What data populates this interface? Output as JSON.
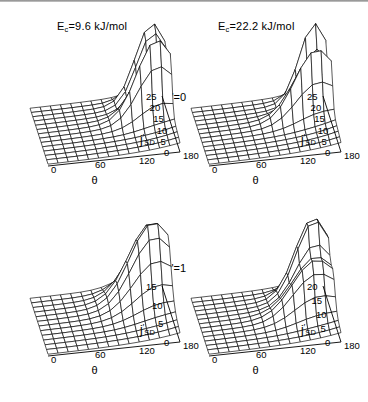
{
  "figure": {
    "background": "#ffffff",
    "line_color": "#000000",
    "top_rule_color": "#8a8a8a"
  },
  "column_titles": [
    {
      "text": "E",
      "sub": "c",
      "rest": "=9.6 kJ/mol",
      "x": 57,
      "y": 20
    },
    {
      "text": "E",
      "sub": "c",
      "rest": "=22.2 kJ/mol",
      "x": 218,
      "y": 20
    }
  ],
  "row_labels": [
    {
      "text": "v'=0",
      "x": 166,
      "y": 91
    },
    {
      "text": "v'=1",
      "x": 166,
      "y": 262
    }
  ],
  "axes": {
    "depth_name": "j'",
    "depth_sub": "SD",
    "angle_name": "θ",
    "angle_ticks": [
      "0",
      "60",
      "120",
      "180"
    ]
  },
  "chart_data": {
    "type": "surface",
    "xlabel": "θ",
    "ylabel": "j'_SD",
    "zlabel": "population",
    "grid": true,
    "legend": "none",
    "x": [
      0,
      60,
      120,
      180
    ],
    "panels": [
      {
        "id": "ec96-v0",
        "collision_energy_kJmol": 9.6,
        "vibrational_state": 0,
        "row": 0,
        "col": 0,
        "plot_x": 18,
        "plot_y": 48,
        "j_ticks": [
          "25",
          "20",
          "15",
          "10",
          "5",
          "0"
        ],
        "j_range": [
          0,
          25
        ],
        "theta_range": [
          0,
          180
        ],
        "nj": 13,
        "ntheta": 13,
        "peaks": [
          {
            "j": 20.5,
            "theta": 18,
            "height": 1.0,
            "sigma_j": 2.1,
            "sigma_theta": 22
          },
          {
            "j": 13.5,
            "theta": 20,
            "height": 0.93,
            "sigma_j": 2.3,
            "sigma_theta": 26
          }
        ],
        "baseline": 0.02,
        "tail": 0.16
      },
      {
        "id": "ec222-v0",
        "collision_energy_kJmol": 22.2,
        "vibrational_state": 0,
        "row": 0,
        "col": 1,
        "plot_x": 179,
        "plot_y": 48,
        "j_ticks": [
          "25",
          "20",
          "15",
          "10",
          "5",
          "0"
        ],
        "j_range": [
          0,
          25
        ],
        "theta_range": [
          0,
          180
        ],
        "nj": 13,
        "ntheta": 13,
        "peaks": [
          {
            "j": 21.0,
            "theta": 16,
            "height": 1.0,
            "sigma_j": 1.9,
            "sigma_theta": 20
          },
          {
            "j": 14.0,
            "theta": 22,
            "height": 0.88,
            "sigma_j": 2.2,
            "sigma_theta": 28
          }
        ],
        "baseline": 0.02,
        "tail": 0.18
      },
      {
        "id": "ec96-v1",
        "collision_energy_kJmol": 9.6,
        "vibrational_state": 1,
        "row": 1,
        "col": 0,
        "plot_x": 18,
        "plot_y": 238,
        "j_ticks": [
          "15",
          "10",
          "5",
          "0"
        ],
        "j_range": [
          0,
          16
        ],
        "theta_range": [
          0,
          180
        ],
        "nj": 12,
        "ntheta": 13,
        "peaks": [
          {
            "j": 11.0,
            "theta": 22,
            "height": 1.0,
            "sigma_j": 2.9,
            "sigma_theta": 30
          }
        ],
        "baseline": 0.02,
        "tail": 0.17
      },
      {
        "id": "ec222-v1",
        "collision_energy_kJmol": 22.2,
        "vibrational_state": 1,
        "row": 1,
        "col": 1,
        "plot_x": 179,
        "plot_y": 238,
        "j_ticks": [
          "20",
          "15",
          "10",
          "5",
          "0"
        ],
        "j_range": [
          0,
          21
        ],
        "theta_range": [
          0,
          180
        ],
        "nj": 13,
        "ntheta": 13,
        "peaks": [
          {
            "j": 15.5,
            "theta": 20,
            "height": 1.0,
            "sigma_j": 2.2,
            "sigma_theta": 24
          },
          {
            "j": 9.5,
            "theta": 26,
            "height": 0.6,
            "sigma_j": 2.4,
            "sigma_theta": 30
          }
        ],
        "baseline": 0.02,
        "tail": 0.17
      }
    ]
  }
}
